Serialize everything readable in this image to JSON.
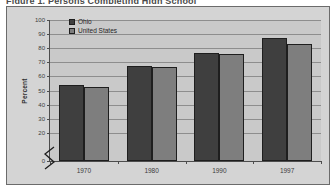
{
  "title_fragment": "Figure 1. Persons Completing High School",
  "chart_data": {
    "type": "bar",
    "title": "",
    "xlabel": "",
    "ylabel": "Percent",
    "categories": [
      "1970",
      "1980",
      "1990",
      "1997"
    ],
    "series": [
      {
        "name": "Ohio",
        "color": "#3f3f3f",
        "values": [
          54,
          67.5,
          76.5,
          87
        ]
      },
      {
        "name": "United States",
        "color": "#7e7e7e",
        "values": [
          52.5,
          67,
          76,
          83
        ]
      }
    ],
    "ylim": [
      0,
      100
    ],
    "yticks": [
      0,
      20,
      30,
      40,
      50,
      60,
      70,
      80,
      90,
      100
    ],
    "ytick_labels": [
      "0",
      "20",
      "30",
      "40",
      "50",
      "60",
      "70",
      "80",
      "90",
      "100"
    ],
    "grid": true,
    "axis_break": true,
    "legend_position": "top-left",
    "legend": [
      "Ohio",
      "United States"
    ]
  },
  "colors": {
    "figure_background": "#ffffff",
    "frame_background": "#d4d4d4",
    "plot_background": "#c9c9c9",
    "gridline": "#8d8d8d",
    "axis": "#4d4d4d",
    "text": "#3c3c3c"
  }
}
